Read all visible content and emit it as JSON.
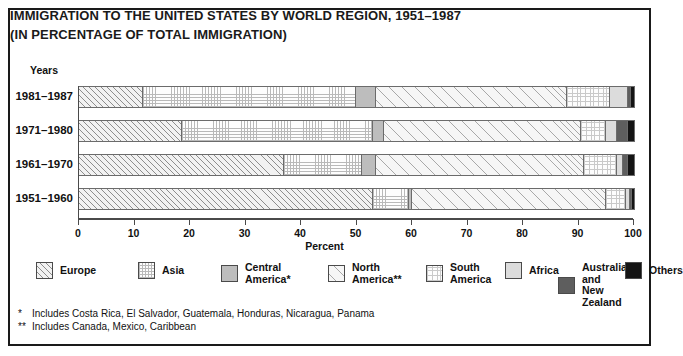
{
  "title": {
    "line1": "IMMIGRATION TO THE UNITED STATES BY WORLD REGION, 1951–1987",
    "line2": "(IN PERCENTAGE OF TOTAL IMMIGRATION)"
  },
  "axis": {
    "y_axis_title": "Years",
    "x_axis_title": "Percent",
    "x_ticks": [
      "0",
      "10",
      "20",
      "30",
      "40",
      "50",
      "60",
      "70",
      "80",
      "90",
      "100"
    ]
  },
  "legend": {
    "items": [
      {
        "label": "Europe",
        "pattern": "diagonal-hatch",
        "color": "#f2f2f2"
      },
      {
        "label": "Asia",
        "pattern": "fine-grid",
        "color": "#fdfdfd"
      },
      {
        "label": "Central\nAmerica*",
        "pattern": "solid-mid-gray",
        "color": "#bdbdbd"
      },
      {
        "label": "North\nAmerica**",
        "pattern": "light-diagonal-hatch",
        "color": "#f6f6f6"
      },
      {
        "label": "South\nAmerica",
        "pattern": "fine-grid",
        "color": "#fdfdfd"
      },
      {
        "label": "Africa",
        "pattern": "solid-light-gray",
        "color": "#dcdcdc"
      },
      {
        "label": "Australia and\nNew Zealand",
        "pattern": "solid-dark-gray",
        "color": "#5e5e5e"
      },
      {
        "label": "Others",
        "pattern": "solid-black",
        "color": "#141414"
      }
    ]
  },
  "notes": [
    {
      "marker": "*",
      "text": "Includes Costa Rica, El Salvador, Guatemala, Honduras, Nicaragua, Panama"
    },
    {
      "marker": "**",
      "text": "Includes Canada, Mexico, Caribbean"
    }
  ],
  "chart_data": {
    "type": "bar",
    "orientation": "horizontal",
    "stacked": true,
    "title": "IMMIGRATION TO THE UNITED STATES BY WORLD REGION, 1951–1987 (IN PERCENTAGE OF TOTAL IMMIGRATION)",
    "xlabel": "Percent",
    "ylabel": "Years",
    "xlim": [
      0,
      100
    ],
    "xticks": [
      0,
      10,
      20,
      30,
      40,
      50,
      60,
      70,
      80,
      90,
      100
    ],
    "grid": false,
    "legend_position": "bottom",
    "categories": [
      "1981–1987",
      "1971–1980",
      "1961–1970",
      "1951–1960"
    ],
    "series": [
      {
        "name": "Europe",
        "values": [
          11.5,
          18.5,
          37.0,
          53.0
        ]
      },
      {
        "name": "Asia",
        "values": [
          38.5,
          34.5,
          14.0,
          6.5
        ]
      },
      {
        "name": "Central America*",
        "values": [
          3.5,
          2.0,
          2.5,
          0.5
        ]
      },
      {
        "name": "North America**",
        "values": [
          34.5,
          35.5,
          37.5,
          35.0
        ]
      },
      {
        "name": "South America",
        "values": [
          7.7,
          4.5,
          6.0,
          3.5
        ]
      },
      {
        "name": "Africa",
        "values": [
          3.3,
          2.0,
          1.0,
          0.8
        ]
      },
      {
        "name": "Australia and New Zealand",
        "values": [
          0.4,
          2.0,
          1.0,
          0.4
        ]
      },
      {
        "name": "Others",
        "values": [
          0.6,
          1.0,
          1.0,
          0.3
        ]
      }
    ]
  }
}
